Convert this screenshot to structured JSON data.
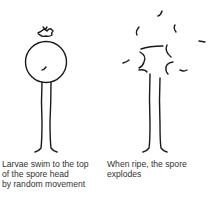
{
  "panels": [
    {
      "id": "larvae-swim",
      "caption": "Larvae swim to the top\nof the spore head\nby random movement",
      "illustration": "spore-head-with-larvae"
    },
    {
      "id": "spore-explodes",
      "caption": "When ripe, the spore\nexplodes",
      "illustration": "exploding-spore"
    }
  ],
  "colors": {
    "line": "#1a1a1a",
    "text": "#333333",
    "background": "#ffffff"
  }
}
